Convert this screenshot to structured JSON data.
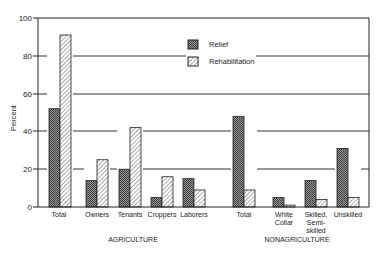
{
  "chart_data": {
    "type": "bar",
    "title": "",
    "xlabel": "",
    "ylabel": "Percent",
    "ylim": [
      0,
      100
    ],
    "yticks": [
      0,
      20,
      40,
      60,
      80,
      100
    ],
    "grid": true,
    "legend_position": "top-center",
    "groups": [
      {
        "label": "AGRICULTURE",
        "categories": [
          "Total",
          "Owners",
          "Tenants",
          "Croppers",
          "Laborers"
        ]
      },
      {
        "label": "NONAGRICULTURE",
        "categories": [
          "Total",
          "White Collar",
          "Skilled, Semi-skilled",
          "Unskilled"
        ]
      }
    ],
    "categories": [
      "Total",
      "Owners",
      "Tenants",
      "Croppers",
      "Laborers",
      "Total",
      "White Collar",
      "Skilled, Semi-skilled",
      "Unskilled"
    ],
    "series": [
      {
        "name": "Relief",
        "pattern": "crosshatch-dark",
        "values": [
          52,
          14,
          20,
          5,
          15,
          48,
          5,
          14,
          31
        ]
      },
      {
        "name": "Rehabilitation",
        "pattern": "diagonal-hatch",
        "values": [
          91,
          25,
          42,
          16,
          9,
          9,
          1,
          4,
          5
        ]
      }
    ]
  },
  "labels": {
    "ylabel": "Percent",
    "yticks": [
      "0",
      "20",
      "40",
      "60",
      "80",
      "100"
    ],
    "legend": [
      "Relief",
      "Rehabilitation"
    ],
    "cats": {
      "agri_total": "Total",
      "owners": "Owners",
      "tenants": "Tenants",
      "croppers": "Croppers",
      "laborers": "Laborers",
      "nonagri_total": "Total",
      "white": "White",
      "collar": "Collar",
      "skilled": "Skilled,",
      "semi": "Semi-",
      "skilled2": "skilled",
      "unskilled": "Unskilled"
    },
    "groups": [
      "AGRICULTURE",
      "NONAGRICULTURE"
    ]
  }
}
